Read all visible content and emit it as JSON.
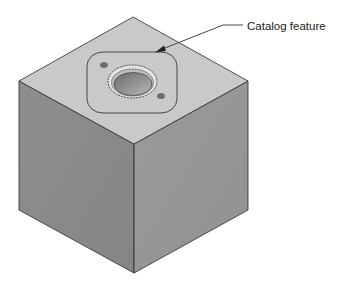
{
  "figure": {
    "callout": {
      "label": "Catalog feature"
    },
    "colors": {
      "background": "#ffffff",
      "top_face": "#c9c9c9",
      "left_face": "#8a8a8a",
      "right_face": "#969696",
      "edge": "#2a2a2a",
      "bore_outer": "#e4e4e4",
      "bore_inner": "#8c8c8c",
      "bolt_hole": "#6e6e6e",
      "leader": "#333333"
    }
  }
}
